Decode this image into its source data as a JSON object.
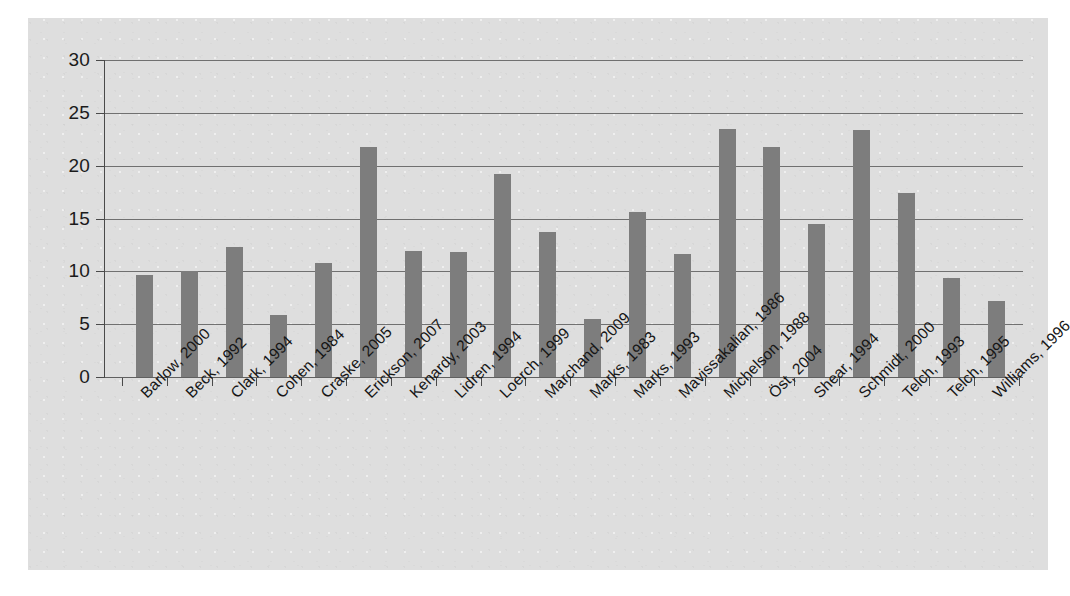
{
  "chart_data": {
    "type": "bar",
    "title": "",
    "subtitle": "",
    "xlabel": "",
    "ylabel": "",
    "ylim": [
      0,
      30
    ],
    "yticks": [
      0,
      5,
      10,
      15,
      20,
      25,
      30
    ],
    "grid": true,
    "legend": false,
    "legend_position": "none",
    "orientation": "vertical",
    "bar_color": "#7d7d7d",
    "plot_background": "#dedede",
    "axis_color": "#4a4a4a",
    "categories": [
      "Barlow, 2000",
      "Beck, 1992",
      "Clark, 1994",
      "Cohen, 1984",
      "Craske, 2005",
      "Erickson, 2007",
      "Kenardy, 2003",
      "Lidren, 1994",
      "Loerch, 1999",
      "Marchand, 2009",
      "Marks, 1983",
      "Marks, 1993",
      "Mavissakalian, 1986",
      "Michelson, 1988",
      "Öst, 2004",
      "Shear, 1994",
      "Schmidt, 2000",
      "Telch, 1993",
      "Telch, 1995",
      "Williams, 1996"
    ],
    "values": [
      9.7,
      10.0,
      12.3,
      5.9,
      10.8,
      21.8,
      11.9,
      11.8,
      19.2,
      13.7,
      5.5,
      15.6,
      11.6,
      23.5,
      21.8,
      14.5,
      23.4,
      17.4,
      9.4,
      7.2
    ]
  }
}
